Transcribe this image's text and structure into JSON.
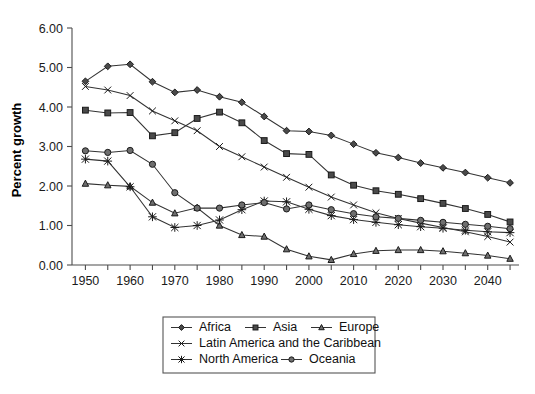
{
  "chart_data": {
    "type": "line",
    "title": "",
    "xlabel": "",
    "ylabel": "Percent growth",
    "xlim": [
      1947,
      2047
    ],
    "ylim": [
      0.0,
      6.0
    ],
    "grid": false,
    "legend_position": "bottom",
    "x": [
      1950,
      1955,
      1960,
      1965,
      1970,
      1975,
      1980,
      1985,
      1990,
      1995,
      2000,
      2005,
      2010,
      2015,
      2020,
      2025,
      2030,
      2035,
      2040,
      2045
    ],
    "xtick_labels": [
      "1950",
      "1960",
      "1970",
      "1980",
      "1990",
      "2000",
      "2010",
      "2020",
      "2030",
      "2040"
    ],
    "xtick_values": [
      1950,
      1960,
      1970,
      1980,
      1990,
      2000,
      2010,
      2020,
      2030,
      2040
    ],
    "xminor_values": [
      1955,
      1965,
      1975,
      1985,
      1995,
      2005,
      2015,
      2025,
      2035,
      2045
    ],
    "ytick_labels": [
      "0.00",
      "1.00",
      "2.00",
      "3.00",
      "4.00",
      "5.00",
      "6.00"
    ],
    "ytick_values": [
      0,
      1,
      2,
      3,
      4,
      5,
      6
    ],
    "series": [
      {
        "name": "Africa",
        "marker": "diamond",
        "values": [
          4.65,
          5.03,
          5.08,
          4.64,
          4.37,
          4.43,
          4.26,
          4.12,
          3.76,
          3.4,
          3.38,
          3.28,
          3.06,
          2.84,
          2.72,
          2.58,
          2.46,
          2.34,
          2.21,
          2.08
        ]
      },
      {
        "name": "Asia",
        "marker": "square",
        "values": [
          3.92,
          3.85,
          3.86,
          3.27,
          3.35,
          3.71,
          3.87,
          3.6,
          3.15,
          2.82,
          2.8,
          2.28,
          2.02,
          1.88,
          1.79,
          1.68,
          1.56,
          1.43,
          1.28,
          1.09
        ]
      },
      {
        "name": "Europe",
        "marker": "triangle",
        "values": [
          2.06,
          2.02,
          1.99,
          1.58,
          1.31,
          1.45,
          1.0,
          0.76,
          0.72,
          0.4,
          0.22,
          0.13,
          0.28,
          0.36,
          0.38,
          0.38,
          0.35,
          0.3,
          0.24,
          0.16
        ]
      },
      {
        "name": "Latin America and the Caribbean",
        "marker": "cross-x",
        "values": [
          4.52,
          4.43,
          4.29,
          3.9,
          3.65,
          3.4,
          3.0,
          2.74,
          2.48,
          2.22,
          1.97,
          1.72,
          1.52,
          1.32,
          1.18,
          1.06,
          0.95,
          0.84,
          0.72,
          0.58
        ]
      },
      {
        "name": "North America",
        "marker": "star",
        "values": [
          2.68,
          2.63,
          1.98,
          1.22,
          0.95,
          1.0,
          1.14,
          1.4,
          1.62,
          1.6,
          1.41,
          1.25,
          1.15,
          1.08,
          1.02,
          0.97,
          0.93,
          0.88,
          0.84,
          0.82
        ]
      },
      {
        "name": "Oceania",
        "marker": "circle",
        "values": [
          2.89,
          2.85,
          2.9,
          2.55,
          1.83,
          1.44,
          1.44,
          1.52,
          1.58,
          1.42,
          1.52,
          1.4,
          1.3,
          1.22,
          1.18,
          1.13,
          1.08,
          1.03,
          0.98,
          0.92
        ]
      }
    ],
    "legend_rows": [
      [
        "Africa",
        "Asia",
        "Europe"
      ],
      [
        "Latin America and the Caribbean"
      ],
      [
        "North America",
        "Oceania"
      ]
    ]
  }
}
